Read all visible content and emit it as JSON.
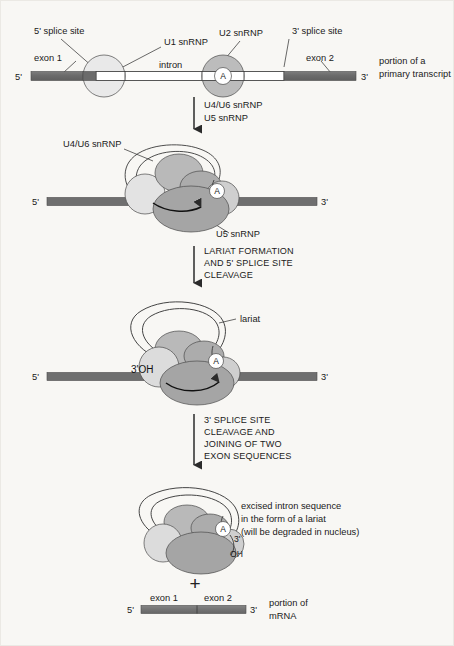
{
  "figure": {
    "colors": {
      "background": "#f8f7f4",
      "exon": "#6f6f6f",
      "exon_mrna": "#767676",
      "intron": "#ffffff",
      "snrnp_light": "#e9e9e9",
      "snrnp_mid": "#b9b9b9",
      "snrnp_dark": "#a2a2a2",
      "outline": "#3b3b3b",
      "text": "#1a1a1a"
    }
  },
  "stage1": {
    "name": "primary transcript with U1 and U2 snRNP bound",
    "labels": {
      "splice5": "5' splice site",
      "u1": "U1 snRNP",
      "u2": "U2 snRNP",
      "splice3": "3' splice site",
      "exon1": "exon 1",
      "intron": "intron",
      "exon2": "exon 2",
      "end5": "5'",
      "end3": "3'",
      "branch_point": "A",
      "caption_line1": "portion of a",
      "caption_line2": "primary transcript"
    }
  },
  "arrow1": {
    "line1": "U4/U6 snRNP",
    "line2": "U5 snRNP"
  },
  "stage2": {
    "name": "assembled spliceosome",
    "labels": {
      "u46": "U4/U6 snRNP",
      "u5": "U5 snRNP",
      "end5": "5'",
      "end3": "3'",
      "branch_point": "A"
    }
  },
  "arrow2": {
    "line1": "LARIAT FORMATION",
    "line2": "AND 5' SPLICE SITE",
    "line3": "CLEAVAGE"
  },
  "stage3": {
    "name": "lariat formed and 5' splice site cleaved",
    "labels": {
      "lariat": "lariat",
      "oh": "3'OH",
      "end5": "5'",
      "end3": "3'",
      "branch_point": "A"
    }
  },
  "arrow3": {
    "line1": "3' SPLICE SITE",
    "line2": "CLEAVAGE AND",
    "line3": "JOINING OF TWO",
    "line4": "EXON SEQUENCES"
  },
  "stage4": {
    "name": "excised intron lariat and spliced mRNA",
    "labels": {
      "branch_point": "A",
      "end3": "3'",
      "oh": "OH",
      "note_line1": "excised intron sequence",
      "note_line2": "in the form of a lariat",
      "note_line3": "(will be degraded in nucleus)",
      "plus": "+"
    }
  },
  "product": {
    "name": "spliced mRNA",
    "labels": {
      "exon1": "exon 1",
      "exon2": "exon 2",
      "end5": "5'",
      "end3": "3'",
      "caption_line1": "portion of",
      "caption_line2": "mRNA"
    }
  }
}
